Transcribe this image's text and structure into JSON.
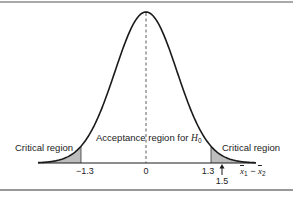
{
  "chart_data": {
    "type": "area",
    "title": "",
    "xlabel": "x̄1 − x̄2",
    "ylabel": "",
    "distribution": "normal",
    "mean": 0,
    "tick_labels": [
      "-1.3",
      "0",
      "1.3"
    ],
    "ticks": [
      -1.3,
      0,
      1.3
    ],
    "observed_value": 1.5,
    "observed_label": "1.5",
    "regions": [
      {
        "name": "Critical region",
        "from": null,
        "to": -1.3,
        "shaded": true
      },
      {
        "name": "Acceptance region for H0",
        "from": -1.3,
        "to": 1.3,
        "shaded": false
      },
      {
        "name": "Critical region",
        "from": 1.3,
        "to": null,
        "shaded": true
      }
    ],
    "annotations": [
      "Critical region",
      "Acceptance region for H0",
      "Critical region",
      "arrow at 1.5"
    ],
    "grid": false,
    "legend": null,
    "center_line": "dashed vertical line at 0"
  },
  "labels": {
    "critical_left": "Critical region",
    "critical_right": "Critical region",
    "acceptance_prefix": "Acceptance region for ",
    "acceptance_h": "H",
    "acceptance_sub": "0",
    "tick_neg": "−1.3",
    "tick_zero": "0",
    "tick_pos": "1.3",
    "observed": "1.5",
    "xaxis_x": "x",
    "xaxis_sub1": "1",
    "xaxis_minus": " − ",
    "xaxis_sub2": "2"
  },
  "colors": {
    "curve": "#1a1a1a",
    "shade": "#bdbdbd",
    "border": "#333333"
  }
}
